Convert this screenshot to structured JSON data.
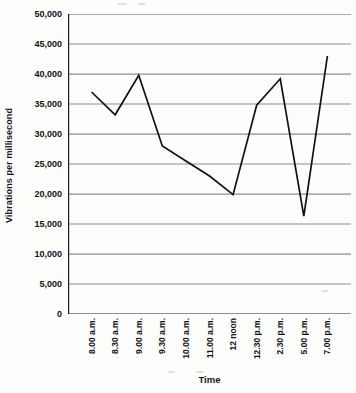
{
  "chart_data": {
    "type": "line",
    "title": "",
    "xlabel": "Time",
    "ylabel": "Vibrations per millisecond",
    "categories": [
      "8.00 a.m.",
      "8.30 a.m.",
      "9.00 a.m.",
      "9.30 a.m.",
      "10.00 a.m.",
      "11.00 a.m.",
      "12 noon",
      "12.30 p.m.",
      "2.30 p.m.",
      "5.00 p.m.",
      "7.00 p.m."
    ],
    "values": [
      37000,
      33200,
      39800,
      28000,
      25500,
      23000,
      19900,
      34800,
      39200,
      16300,
      43000
    ],
    "ylim": [
      0,
      50000
    ],
    "yticks": [
      0,
      5000,
      10000,
      15000,
      20000,
      25000,
      30000,
      35000,
      40000,
      45000,
      50000
    ],
    "ytick_labels": [
      "0",
      "5,000",
      "10,000",
      "15,000",
      "20,000",
      "25,000",
      "30,000",
      "35,000",
      "40,000",
      "45,000",
      "50,000"
    ],
    "grid": "horizontal",
    "legend": "none",
    "series_color": "#111111",
    "grid_color": "#8e8e8e",
    "axis_color": "#1a1a1a"
  }
}
